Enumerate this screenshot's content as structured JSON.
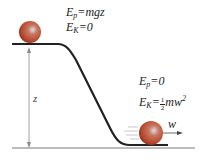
{
  "diagram": {
    "top_state": {
      "ep_symbol": "E",
      "ep_sub": "p",
      "ep_value": "=mgz",
      "ek_symbol": "E",
      "ek_sub": "K",
      "ek_value": "=0"
    },
    "bottom_state": {
      "ep_symbol": "E",
      "ep_sub": "p",
      "ep_value": "=0",
      "ek_symbol": "E",
      "ek_sub": "K",
      "ek_eq": "=",
      "ek_frac_num": "1",
      "ek_frac_den": "2",
      "ek_value": "mw",
      "ek_sup": "2"
    },
    "height_label": "z",
    "velocity_label": "w",
    "colors": {
      "ball": "#b5452c",
      "track": "#222222",
      "arrow": "#777777"
    }
  }
}
